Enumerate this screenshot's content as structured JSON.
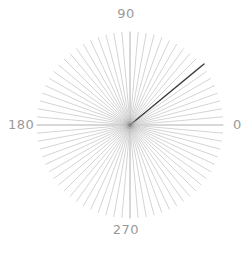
{
  "figure": {
    "name": "polar-rose-plot",
    "type": "polar",
    "background_color": "#ffffff",
    "center_x": 130,
    "center_y": 125,
    "radius": 93
  },
  "axis_labels": {
    "right": "0",
    "top": "90",
    "left": "180",
    "bottom": "270",
    "color": "#9a9a9a"
  },
  "chart_data": {
    "type": "line",
    "title": "",
    "xlabel": "",
    "ylabel": "",
    "theta_unit": "degrees",
    "theta_tick_labels": [
      "0",
      "90",
      "180",
      "270"
    ],
    "theta_ticks": [
      0,
      90,
      180,
      270
    ],
    "theta_direction": "counterclockwise",
    "theta_zero_location": "E",
    "grid": false,
    "legend": false,
    "rlim": [
      0,
      1
    ],
    "spoke_count": 72,
    "spoke_step_degrees": 5,
    "spoke_color": "#c9c9c9",
    "spoke_radius": 93,
    "axis_spoke_color": "#b0b0b0",
    "series": [
      {
        "name": "spokes",
        "color": "#c9c9c9",
        "theta": [
          0,
          5,
          10,
          15,
          20,
          25,
          30,
          35,
          40,
          45,
          50,
          55,
          60,
          65,
          70,
          75,
          80,
          85,
          90,
          95,
          100,
          105,
          110,
          115,
          120,
          125,
          130,
          135,
          140,
          145,
          150,
          155,
          160,
          165,
          170,
          175,
          180,
          185,
          190,
          195,
          200,
          205,
          210,
          215,
          220,
          225,
          230,
          235,
          240,
          245,
          250,
          255,
          260,
          265,
          270,
          275,
          280,
          285,
          290,
          295,
          300,
          305,
          310,
          315,
          320,
          325,
          330,
          335,
          340,
          345,
          350,
          355
        ],
        "values": [
          1,
          1,
          1,
          1,
          1,
          1,
          1,
          1,
          1,
          1,
          1,
          1,
          1,
          1,
          1,
          1,
          1,
          1,
          1,
          1,
          1,
          1,
          1,
          1,
          1,
          1,
          1,
          1,
          1,
          1,
          1,
          1,
          1,
          1,
          1,
          1,
          1,
          1,
          1,
          1,
          1,
          1,
          1,
          1,
          1,
          1,
          1,
          1,
          1,
          1,
          1,
          1,
          1,
          1,
          1,
          1,
          1,
          1,
          1,
          1,
          1,
          1,
          1,
          1,
          1,
          1,
          1,
          1,
          1,
          1,
          1,
          1
        ]
      },
      {
        "name": "highlighted-vector",
        "color": "#3a3a3a",
        "theta": [
          39.5
        ],
        "values": [
          1.03
        ],
        "length_px": 96,
        "angle_degrees": 39.5
      }
    ],
    "annotations": []
  }
}
